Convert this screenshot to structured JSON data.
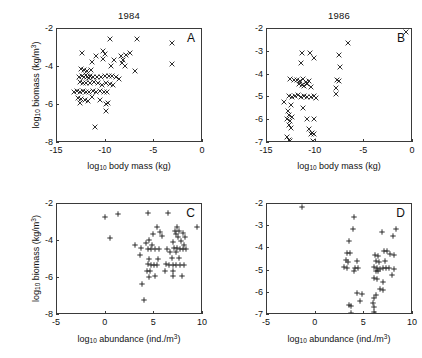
{
  "figure": {
    "background": "#ffffff",
    "axis_color": "#3a3a3a",
    "marker_color": "#1a1a1a"
  },
  "labels": {
    "biomass_axis_prefix": "log",
    "biomass_axis_sub": "10",
    "biomass_axis_main": " biomass (kg/m",
    "biomass_axis_sup": "3",
    "biomass_axis_tail": ")",
    "bodymass_axis_main": " body mass (kg)",
    "abundance_axis_main": " abundance (ind./m",
    "abundance_axis_sup": "3",
    "abundance_axis_tail": ")"
  },
  "chart_data": [
    {
      "id": "A",
      "type": "scatter",
      "title": "1984",
      "panel_letter": "A",
      "marker": "x",
      "xlabel": "log10 body mass (kg)",
      "ylabel": "log10 biomass (kg/m3)",
      "xlim": [
        -15,
        0
      ],
      "ylim": [
        -8,
        -2
      ],
      "xticks": [
        -15,
        -10,
        -5,
        0
      ],
      "xtick_labels": [
        "-15",
        "-10",
        "-5",
        "0"
      ],
      "yticks": [
        -2,
        -4,
        -6,
        -8
      ],
      "ytick_labels": [
        "-2",
        "-4",
        "-6",
        "-8"
      ],
      "grid": false,
      "legend": false,
      "points": [
        [
          -9.55,
          -2.52
        ],
        [
          -6.75,
          -2.5
        ],
        [
          -3.15,
          -2.72
        ],
        [
          -3.15,
          -3.82
        ],
        [
          -12.4,
          -3.28
        ],
        [
          -11.0,
          -3.42
        ],
        [
          -10.3,
          -3.18
        ],
        [
          -10.05,
          -3.3
        ],
        [
          -10.3,
          -3.6
        ],
        [
          -11.4,
          -3.72
        ],
        [
          -9.1,
          -3.62
        ],
        [
          -8.45,
          -3.42
        ],
        [
          -7.95,
          -3.35
        ],
        [
          -7.45,
          -3.28
        ],
        [
          -8.2,
          -3.62
        ],
        [
          -9.5,
          -3.95
        ],
        [
          -8.0,
          -3.95
        ],
        [
          -7.0,
          -4.22
        ],
        [
          -8.35,
          -3.78
        ],
        [
          -12.5,
          -4.1
        ],
        [
          -12.2,
          -4.18
        ],
        [
          -11.9,
          -4.2
        ],
        [
          -11.55,
          -4.15
        ],
        [
          -12.0,
          -4.42
        ],
        [
          -11.6,
          -4.45
        ],
        [
          -12.7,
          -4.5
        ],
        [
          -12.45,
          -4.45
        ],
        [
          -12.2,
          -4.52
        ],
        [
          -11.95,
          -4.55
        ],
        [
          -11.7,
          -4.6
        ],
        [
          -11.3,
          -4.5
        ],
        [
          -10.9,
          -4.52
        ],
        [
          -10.5,
          -4.5
        ],
        [
          -10.1,
          -4.45
        ],
        [
          -9.7,
          -4.48
        ],
        [
          -9.35,
          -4.45
        ],
        [
          -8.95,
          -4.5
        ],
        [
          -8.6,
          -4.62
        ],
        [
          -12.6,
          -4.8
        ],
        [
          -12.3,
          -4.85
        ],
        [
          -12.0,
          -4.82
        ],
        [
          -11.6,
          -4.85
        ],
        [
          -11.2,
          -4.78
        ],
        [
          -10.8,
          -4.82
        ],
        [
          -10.4,
          -4.95
        ],
        [
          -10.0,
          -4.85
        ],
        [
          -9.6,
          -4.9
        ],
        [
          -9.2,
          -4.95
        ],
        [
          -13.3,
          -5.3
        ],
        [
          -12.9,
          -5.25
        ],
        [
          -12.6,
          -5.32
        ],
        [
          -12.3,
          -5.28
        ],
        [
          -12.0,
          -5.3
        ],
        [
          -11.7,
          -5.3
        ],
        [
          -11.35,
          -5.25
        ],
        [
          -11.0,
          -5.3
        ],
        [
          -10.6,
          -5.28
        ],
        [
          -10.2,
          -5.3
        ],
        [
          -9.85,
          -5.32
        ],
        [
          -12.85,
          -5.62
        ],
        [
          -12.5,
          -5.7
        ],
        [
          -12.15,
          -5.72
        ],
        [
          -11.8,
          -5.78
        ],
        [
          -11.45,
          -5.6
        ],
        [
          -12.6,
          -5.9
        ],
        [
          -10.6,
          -5.72
        ],
        [
          -10.0,
          -5.95
        ],
        [
          -9.75,
          -5.9
        ],
        [
          -9.95,
          -6.3
        ],
        [
          -11.1,
          -7.18
        ]
      ]
    },
    {
      "id": "B",
      "type": "scatter",
      "title": "1986",
      "panel_letter": "B",
      "marker": "x",
      "xlabel": "log10 body mass (kg)",
      "ylabel": "",
      "xlim": [
        -15,
        0
      ],
      "ylim": [
        -7,
        -2
      ],
      "xticks": [
        -15,
        -10,
        -5,
        0
      ],
      "xtick_labels": [
        "-15",
        "-10",
        "-5",
        "0"
      ],
      "yticks": [
        -2,
        -3,
        -4,
        -5,
        -6,
        -7
      ],
      "ytick_labels": [
        "-2",
        "-3",
        "-4",
        "-5",
        "-6",
        "-7"
      ],
      "grid": false,
      "legend": false,
      "points": [
        [
          -0.75,
          -2.12
        ],
        [
          -6.65,
          -2.6
        ],
        [
          -11.4,
          -3.05
        ],
        [
          -10.6,
          -3.05
        ],
        [
          -7.6,
          -3.15
        ],
        [
          -11.5,
          -3.5
        ],
        [
          -10.2,
          -3.28
        ],
        [
          -7.45,
          -3.68
        ],
        [
          -12.6,
          -4.18
        ],
        [
          -12.2,
          -4.25
        ],
        [
          -11.9,
          -4.22
        ],
        [
          -11.6,
          -4.3
        ],
        [
          -11.3,
          -4.2
        ],
        [
          -11.0,
          -4.32
        ],
        [
          -10.7,
          -4.28
        ],
        [
          -11.75,
          -4.42
        ],
        [
          -11.45,
          -4.45
        ],
        [
          -11.15,
          -4.5
        ],
        [
          -10.85,
          -4.4
        ],
        [
          -10.5,
          -4.55
        ],
        [
          -7.85,
          -4.25
        ],
        [
          -7.65,
          -4.3
        ],
        [
          -7.9,
          -4.6
        ],
        [
          -13.3,
          -5.18
        ],
        [
          -12.7,
          -4.95
        ],
        [
          -12.4,
          -5.0
        ],
        [
          -12.1,
          -4.95
        ],
        [
          -11.8,
          -4.9
        ],
        [
          -11.5,
          -4.98
        ],
        [
          -11.2,
          -4.95
        ],
        [
          -10.85,
          -5.0
        ],
        [
          -10.5,
          -5.0
        ],
        [
          -10.2,
          -4.95
        ],
        [
          -9.95,
          -5.02
        ],
        [
          -7.9,
          -4.85
        ],
        [
          -12.55,
          -5.35
        ],
        [
          -11.35,
          -5.45
        ],
        [
          -12.85,
          -5.6
        ],
        [
          -12.7,
          -5.75
        ],
        [
          -12.45,
          -5.88
        ],
        [
          -12.9,
          -5.95
        ],
        [
          -12.6,
          -6.05
        ],
        [
          -10.85,
          -5.95
        ],
        [
          -10.15,
          -5.95
        ],
        [
          -12.75,
          -6.2
        ],
        [
          -12.5,
          -6.35
        ],
        [
          -10.7,
          -6.4
        ],
        [
          -10.35,
          -6.55
        ],
        [
          -10.2,
          -6.6
        ],
        [
          -10.5,
          -6.62
        ],
        [
          -12.9,
          -6.75
        ],
        [
          -12.75,
          -6.85
        ],
        [
          -12.65,
          -6.92
        ],
        [
          -10.3,
          -6.9
        ]
      ]
    },
    {
      "id": "C",
      "type": "scatter",
      "title": "",
      "panel_letter": "C",
      "marker": "+",
      "xlabel": "log10 abundance (ind./m3)",
      "ylabel": "log10 biomass (kg/m3)",
      "xlim": [
        -5,
        10
      ],
      "ylim": [
        -8,
        -2
      ],
      "xticks": [
        -5,
        0,
        5,
        10
      ],
      "xtick_labels": [
        "-5",
        "0",
        "5",
        "10"
      ],
      "yticks": [
        -2,
        -4,
        -6,
        -8
      ],
      "ytick_labels": [
        "-2",
        "-4",
        "-6",
        "-8"
      ],
      "grid": false,
      "legend": false,
      "points": [
        [
          1.25,
          -2.52
        ],
        [
          4.3,
          -2.5
        ],
        [
          6.45,
          -2.5
        ],
        [
          -0.05,
          -2.72
        ],
        [
          0.45,
          -3.82
        ],
        [
          5.25,
          -3.25
        ],
        [
          7.35,
          -3.22
        ],
        [
          9.35,
          -3.25
        ],
        [
          7.15,
          -3.45
        ],
        [
          7.55,
          -3.45
        ],
        [
          5.55,
          -3.5
        ],
        [
          7.25,
          -3.62
        ],
        [
          7.9,
          -3.55
        ],
        [
          4.85,
          -3.6
        ],
        [
          5.75,
          -3.75
        ],
        [
          7.4,
          -3.78
        ],
        [
          8.1,
          -3.8
        ],
        [
          4.5,
          -3.95
        ],
        [
          4.1,
          -4.1
        ],
        [
          6.95,
          -4.05
        ],
        [
          7.75,
          -4.0
        ],
        [
          3.05,
          -4.22
        ],
        [
          4.75,
          -4.2
        ],
        [
          8.0,
          -4.2
        ],
        [
          3.6,
          -4.4
        ],
        [
          4.35,
          -4.45
        ],
        [
          4.7,
          -4.45
        ],
        [
          5.05,
          -4.45
        ],
        [
          5.45,
          -4.45
        ],
        [
          6.25,
          -4.45
        ],
        [
          7.0,
          -4.4
        ],
        [
          7.35,
          -4.38
        ],
        [
          7.6,
          -4.42
        ],
        [
          7.9,
          -4.45
        ],
        [
          8.3,
          -4.42
        ],
        [
          6.6,
          -4.6
        ],
        [
          7.2,
          -4.6
        ],
        [
          3.55,
          -4.75
        ],
        [
          4.5,
          -4.95
        ],
        [
          5.35,
          -4.95
        ],
        [
          6.85,
          -4.9
        ],
        [
          7.5,
          -4.9
        ],
        [
          4.35,
          -5.25
        ],
        [
          4.65,
          -5.28
        ],
        [
          4.95,
          -5.3
        ],
        [
          5.3,
          -5.3
        ],
        [
          6.15,
          -5.25
        ],
        [
          6.55,
          -5.3
        ],
        [
          6.9,
          -5.3
        ],
        [
          7.25,
          -5.3
        ],
        [
          7.65,
          -5.28
        ],
        [
          8.05,
          -5.3
        ],
        [
          4.25,
          -5.6
        ],
        [
          4.6,
          -5.62
        ],
        [
          6.1,
          -5.6
        ],
        [
          6.9,
          -5.6
        ],
        [
          4.45,
          -5.95
        ],
        [
          5.05,
          -5.9
        ],
        [
          6.9,
          -5.9
        ],
        [
          7.85,
          -5.9
        ],
        [
          3.7,
          -6.35
        ],
        [
          3.95,
          -7.18
        ]
      ]
    },
    {
      "id": "D",
      "type": "scatter",
      "title": "",
      "panel_letter": "D",
      "marker": "+",
      "xlabel": "log10 abundance (ind./m3)",
      "ylabel": "",
      "xlim": [
        -5,
        10
      ],
      "ylim": [
        -7,
        -2
      ],
      "xticks": [
        -5,
        0,
        5,
        10
      ],
      "xtick_labels": [
        "-5",
        "0",
        "5",
        "10"
      ],
      "yticks": [
        -2,
        -3,
        -4,
        -5,
        -6,
        -7
      ],
      "ytick_labels": [
        "-2",
        "-3",
        "-4",
        "-5",
        "-6",
        "-7"
      ],
      "grid": false,
      "legend": false,
      "points": [
        [
          -1.45,
          -2.12
        ],
        [
          3.95,
          -2.6
        ],
        [
          3.85,
          -3.12
        ],
        [
          6.85,
          -3.28
        ],
        [
          8.25,
          -3.12
        ],
        [
          7.95,
          -3.45
        ],
        [
          3.45,
          -3.68
        ],
        [
          3.25,
          -4.2
        ],
        [
          3.55,
          -4.22
        ],
        [
          7.05,
          -4.1
        ],
        [
          7.35,
          -4.1
        ],
        [
          6.1,
          -4.3
        ],
        [
          6.4,
          -4.35
        ],
        [
          7.6,
          -4.25
        ],
        [
          8.0,
          -4.28
        ],
        [
          3.15,
          -4.5
        ],
        [
          3.35,
          -4.62
        ],
        [
          4.2,
          -4.55
        ],
        [
          6.2,
          -4.55
        ],
        [
          6.55,
          -4.6
        ],
        [
          7.1,
          -4.55
        ],
        [
          2.95,
          -4.85
        ],
        [
          3.25,
          -4.9
        ],
        [
          4.05,
          -4.9
        ],
        [
          4.3,
          -4.9
        ],
        [
          3.9,
          -5.0
        ],
        [
          6.0,
          -4.85
        ],
        [
          6.3,
          -4.9
        ],
        [
          6.6,
          -4.92
        ],
        [
          6.9,
          -4.88
        ],
        [
          7.25,
          -4.88
        ],
        [
          7.55,
          -4.9
        ],
        [
          8.0,
          -4.95
        ],
        [
          6.15,
          -5.0
        ],
        [
          6.45,
          -5.02
        ],
        [
          7.85,
          -5.18
        ],
        [
          5.95,
          -5.35
        ],
        [
          6.35,
          -5.4
        ],
        [
          6.9,
          -5.52
        ],
        [
          6.6,
          -5.85
        ],
        [
          6.95,
          -5.88
        ],
        [
          4.25,
          -6.0
        ],
        [
          4.75,
          -6.05
        ],
        [
          6.15,
          -6.1
        ],
        [
          5.95,
          -6.25
        ],
        [
          4.55,
          -6.35
        ],
        [
          3.45,
          -6.55
        ],
        [
          3.6,
          -6.58
        ],
        [
          5.9,
          -6.45
        ],
        [
          6.0,
          -6.65
        ],
        [
          3.65,
          -6.9
        ],
        [
          5.95,
          -6.88
        ],
        [
          6.05,
          -6.95
        ]
      ]
    }
  ]
}
